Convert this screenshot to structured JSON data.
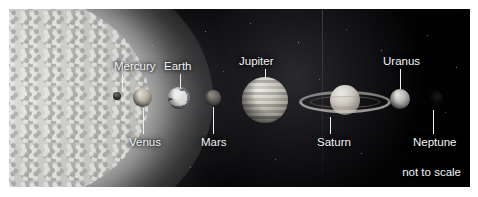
{
  "figure": {
    "caption": "not to scale"
  },
  "bodies": [
    {
      "id": "sun",
      "label": "",
      "label_position": "none"
    },
    {
      "id": "mercury",
      "label": "Mercury",
      "label_position": "above"
    },
    {
      "id": "venus",
      "label": "Venus",
      "label_position": "below"
    },
    {
      "id": "earth",
      "label": "Earth",
      "label_position": "above"
    },
    {
      "id": "mars",
      "label": "Mars",
      "label_position": "below"
    },
    {
      "id": "jupiter",
      "label": "Jupiter",
      "label_position": "above"
    },
    {
      "id": "saturn",
      "label": "Saturn",
      "label_position": "below"
    },
    {
      "id": "uranus",
      "label": "Uranus",
      "label_position": "above"
    },
    {
      "id": "neptune",
      "label": "Neptune",
      "label_position": "below"
    }
  ],
  "labels": {
    "mercury": "Mercury",
    "venus": "Venus",
    "earth": "Earth",
    "mars": "Mars",
    "jupiter": "Jupiter",
    "saturn": "Saturn",
    "uranus": "Uranus",
    "neptune": "Neptune"
  },
  "colors": {
    "background": "#ffffff",
    "space": "#050507",
    "label_text": "#f4f5f6",
    "leader_line": "#eef0f2",
    "sun": "#c6c6c4"
  }
}
